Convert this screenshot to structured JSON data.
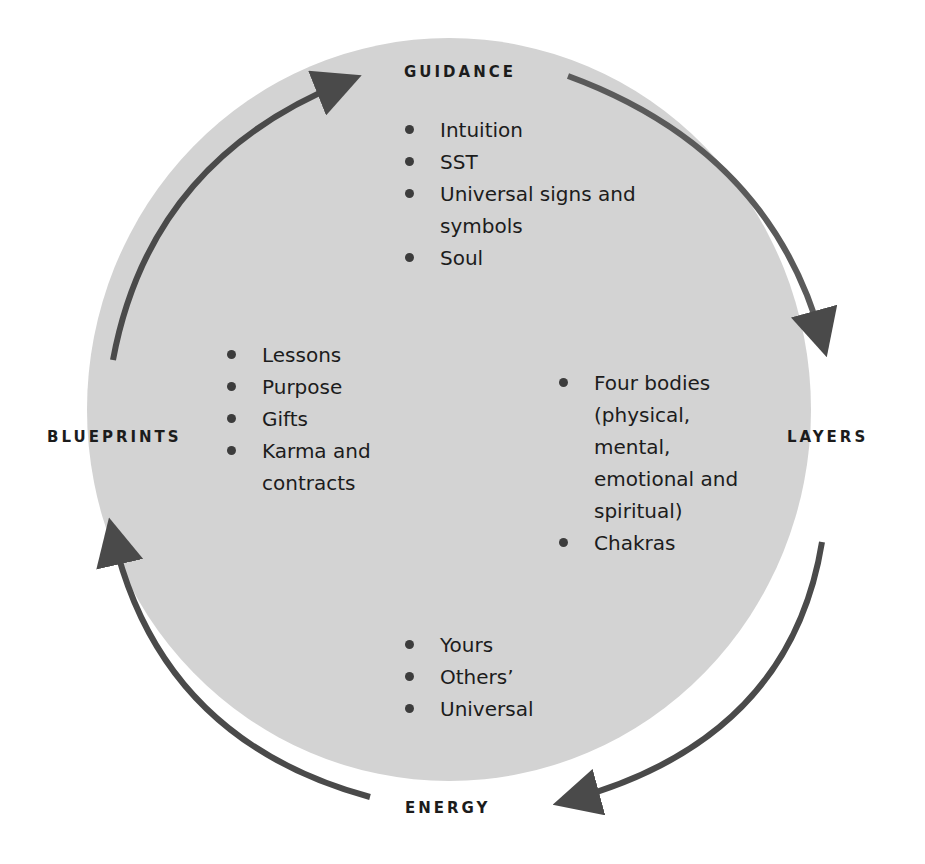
{
  "diagram": {
    "colors": {
      "circle_fill": "#d3d3d3",
      "arrow": "#4a4a4a",
      "text": "#1c1c1c",
      "background": "#ffffff"
    },
    "sections": {
      "guidance": {
        "title": "GUIDANCE",
        "items": [
          "Intuition",
          "SST",
          "Universal signs and symbols",
          "Soul"
        ]
      },
      "layers": {
        "title": "LAYERS",
        "items": [
          "Four bodies (physical, mental, emotional and spiritual)",
          "Chakras"
        ]
      },
      "energy": {
        "title": "ENERGY",
        "items": [
          "Yours",
          "Others’",
          "Universal"
        ]
      },
      "blueprints": {
        "title": "BLUEPRINTS",
        "items": [
          "Lessons",
          "Purpose",
          "Gifts",
          "Karma and contracts"
        ]
      }
    },
    "cycle_order": [
      "GUIDANCE",
      "LAYERS",
      "ENERGY",
      "BLUEPRINTS"
    ],
    "arrow_icons": [
      "arrow-blueprints-to-guidance-icon",
      "arrow-guidance-to-layers-icon",
      "arrow-layers-to-energy-icon",
      "arrow-energy-to-blueprints-icon"
    ]
  }
}
